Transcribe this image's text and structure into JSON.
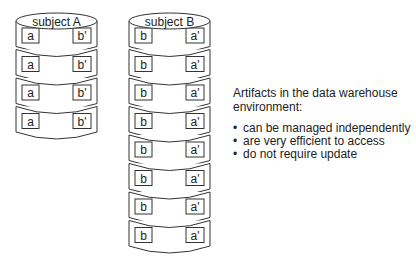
{
  "cylinders": [
    {
      "title": "subject A",
      "records": [
        {
          "left": "a",
          "right": "b'"
        },
        {
          "left": "a",
          "right": "b'"
        },
        {
          "left": "a",
          "right": "b'"
        },
        {
          "left": "a",
          "right": "b'"
        }
      ]
    },
    {
      "title": "subject B",
      "records": [
        {
          "left": "b",
          "right": "a'"
        },
        {
          "left": "b",
          "right": "a'"
        },
        {
          "left": "b",
          "right": "a'"
        },
        {
          "left": "b",
          "right": "a'"
        },
        {
          "left": "b",
          "right": "a'"
        },
        {
          "left": "b",
          "right": "a'"
        },
        {
          "left": "b",
          "right": "a'"
        },
        {
          "left": "b",
          "right": "a'"
        }
      ]
    }
  ],
  "description": {
    "heading": "Artifacts in the data warehouse environment:",
    "bullets": [
      "can be managed independently",
      "are very efficient to access",
      "do not require update"
    ]
  }
}
